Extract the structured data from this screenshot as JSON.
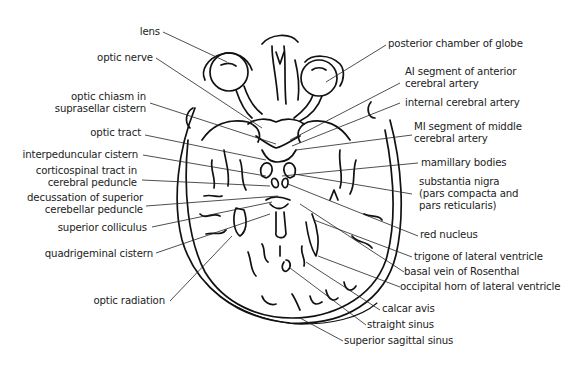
{
  "figure": {
    "style": {
      "ink_color": "#111111",
      "label_color": "#222222",
      "background": "#ffffff"
    }
  },
  "labels_left": [
    {
      "id": "lens",
      "lines": [
        "lens"
      ]
    },
    {
      "id": "optic-nerve",
      "lines": [
        "optic nerve"
      ]
    },
    {
      "id": "optic-chiasm",
      "lines": [
        "optic chiasm in",
        "suprasellar cistern"
      ]
    },
    {
      "id": "optic-tract",
      "lines": [
        "optic tract"
      ]
    },
    {
      "id": "interpeduncular-cistern",
      "lines": [
        "interpeduncular cistern"
      ]
    },
    {
      "id": "corticospinal-tract",
      "lines": [
        "corticospinal tract in",
        "cerebral peduncle"
      ]
    },
    {
      "id": "decussation",
      "lines": [
        "decussation of superior",
        "cerebellar peduncle"
      ]
    },
    {
      "id": "superior-colliculus",
      "lines": [
        "superior colliculus"
      ]
    },
    {
      "id": "quadrigeminal-cistern",
      "lines": [
        "quadrigeminal cistern"
      ]
    },
    {
      "id": "optic-radiation",
      "lines": [
        "optic radiation"
      ]
    }
  ],
  "labels_right": [
    {
      "id": "posterior-chamber",
      "lines": [
        "posterior chamber of globe"
      ]
    },
    {
      "id": "a1-segment",
      "lines": [
        "AI segment of anterior",
        "cerebral artery"
      ]
    },
    {
      "id": "internal-cerebral-artery",
      "lines": [
        "internal cerebral artery"
      ]
    },
    {
      "id": "m1-segment",
      "lines": [
        "MI segment of middle",
        "cerebral artery"
      ]
    },
    {
      "id": "mamillary-bodies",
      "lines": [
        "mamillary bodies"
      ]
    },
    {
      "id": "substantia-nigra",
      "lines": [
        "substantia nigra",
        "(pars compacta and",
        "pars reticularis)"
      ]
    },
    {
      "id": "red-nucleus",
      "lines": [
        "red nucleus"
      ]
    },
    {
      "id": "trigone",
      "lines": [
        "trigone of lateral ventricle"
      ]
    },
    {
      "id": "basal-vein",
      "lines": [
        "basal vein of Rosenthal"
      ]
    },
    {
      "id": "occipital-horn",
      "lines": [
        "occipital horn of lateral ventricle"
      ]
    },
    {
      "id": "calcar-avis",
      "lines": [
        "calcar avis"
      ]
    },
    {
      "id": "straight-sinus",
      "lines": [
        "straight sinus"
      ]
    },
    {
      "id": "superior-sagittal-sinus",
      "lines": [
        "superior sagittal sinus"
      ]
    }
  ]
}
